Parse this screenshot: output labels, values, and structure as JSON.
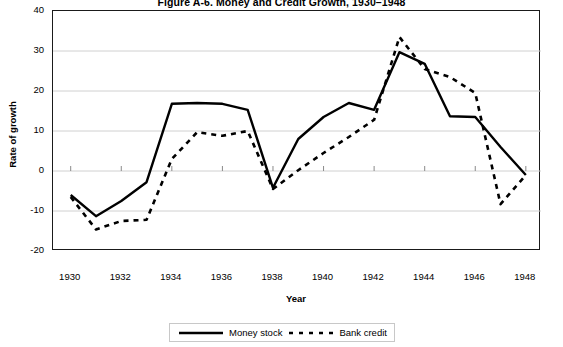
{
  "chart_data": {
    "type": "line",
    "title": "Figure A-6. Money and Credit Growth, 1930–1948",
    "xlabel": "Year",
    "ylabel": "Rate of growth",
    "grid": true,
    "legend_position": "bottom",
    "xlim": [
      1929.3,
      1948.6
    ],
    "ylim": [
      -20,
      40
    ],
    "yticks": [
      "40",
      "30",
      "20",
      "10",
      "0",
      "-10",
      "-20"
    ],
    "ytick_values": [
      40,
      30,
      20,
      10,
      0,
      -10,
      -20
    ],
    "xticks": [
      "1930",
      "1932",
      "1934",
      "1936",
      "1938",
      "1940",
      "1942",
      "1944",
      "1946",
      "1948"
    ],
    "xtick_values": [
      1930,
      1932,
      1934,
      1936,
      1938,
      1940,
      1942,
      1944,
      1946,
      1948
    ],
    "x": [
      1930,
      1931,
      1932,
      1933,
      1934,
      1935,
      1936,
      1937,
      1938,
      1939,
      1940,
      1941,
      1942,
      1943,
      1944,
      1945,
      1946,
      1947,
      1948
    ],
    "series": [
      {
        "name": "Money stock",
        "style": "solid",
        "color": "#000000",
        "values": [
          -6,
          -11.3,
          -7.5,
          -2.8,
          16.8,
          17,
          16.8,
          15.3,
          -4.2,
          8,
          13.5,
          17,
          15.3,
          29.7,
          26.8,
          13.7,
          13.5,
          6,
          -1
        ]
      },
      {
        "name": "Bank credit",
        "style": "dashed",
        "color": "#000000",
        "values": [
          -6.5,
          -14.6,
          -12.5,
          -12.2,
          3,
          9.7,
          8.8,
          10,
          -4.5,
          0.2,
          4.5,
          8.5,
          12.8,
          33.5,
          25.5,
          23.5,
          19.5,
          -8.3,
          -1
        ]
      }
    ]
  },
  "legend": {
    "items": [
      {
        "label": "Money stock",
        "style": "solid"
      },
      {
        "label": "Bank credit",
        "style": "dashed"
      }
    ]
  }
}
